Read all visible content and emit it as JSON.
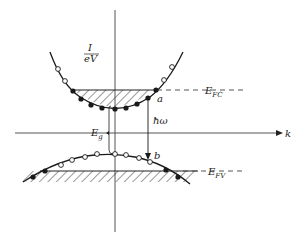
{
  "diagram": {
    "type": "band-structure",
    "colors": {
      "line": "#1a1a1a",
      "dashed": "#555555",
      "hatch": "#333333",
      "axis": "#555555",
      "background": "#ffffff"
    },
    "labels": {
      "quasi_fermi_conduction": "E",
      "quasi_fermi_conduction_sub": "FC",
      "quasi_fermi_valence": "E",
      "quasi_fermi_valence_sub": "FV",
      "gap": "E",
      "gap_sub": "g",
      "photon": "ħω",
      "point_a": "a",
      "point_b": "b",
      "k_axis": "k",
      "fraction_numerator": "I",
      "fraction_denominator": "eV"
    },
    "legend": {
      "filled_circle": "occupied state (electron)",
      "open_circle": "empty state"
    }
  }
}
